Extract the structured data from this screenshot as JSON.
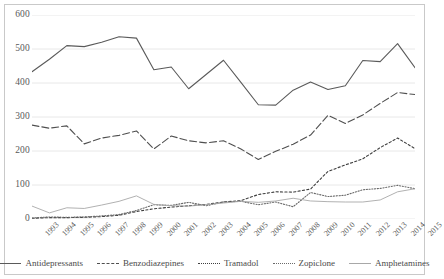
{
  "chart_data": {
    "type": "line",
    "title": "",
    "xlabel": "",
    "ylabel": "",
    "ylim": [
      0,
      600
    ],
    "ytick_values": [
      600,
      500,
      400,
      300,
      200,
      100,
      0
    ],
    "grid": true,
    "grid_axis": "y",
    "legend_position": "bottom",
    "categories": [
      "1993",
      "1994",
      "1995",
      "1996",
      "1997",
      "1998",
      "1999",
      "2000",
      "2001",
      "2002",
      "2003",
      "2004",
      "2005",
      "2006",
      "2007",
      "2008",
      "2009",
      "2010",
      "2011",
      "2012",
      "2013",
      "2014",
      "2015"
    ],
    "series": [
      {
        "name": "Antidepressants",
        "style": "solid",
        "color": "#5a5a5a",
        "values": [
          433,
          470,
          510,
          507,
          520,
          536,
          532,
          439,
          447,
          383,
          425,
          467,
          402,
          336,
          335,
          379,
          403,
          381,
          392,
          466,
          463,
          516,
          445
        ]
      },
      {
        "name": "Benzodiazepines",
        "style": "dashed",
        "color": "#4f4f4f",
        "values": [
          276,
          267,
          274,
          221,
          238,
          246,
          259,
          206,
          244,
          230,
          224,
          230,
          206,
          175,
          199,
          220,
          247,
          305,
          281,
          306,
          340,
          372,
          366
        ]
      },
      {
        "name": "Tramadol",
        "style": "dotted",
        "color": "#3f3f3f",
        "values": [
          2,
          4,
          4,
          5,
          7,
          11,
          22,
          30,
          35,
          39,
          43,
          50,
          54,
          72,
          80,
          79,
          88,
          140,
          159,
          177,
          210,
          238,
          207
        ]
      },
      {
        "name": "Zopiclone",
        "style": "fine-dotted",
        "color": "#6a6a6a",
        "values": [
          3,
          6,
          5,
          6,
          9,
          13,
          25,
          42,
          40,
          49,
          39,
          50,
          52,
          42,
          50,
          36,
          78,
          66,
          70,
          86,
          90,
          99,
          89
        ]
      },
      {
        "name": "Amphetamines",
        "style": "solid-light",
        "color": "#a8a8a8",
        "values": [
          38,
          18,
          33,
          31,
          41,
          52,
          68,
          43,
          39,
          38,
          42,
          47,
          52,
          49,
          53,
          61,
          53,
          51,
          50,
          50,
          56,
          80,
          89
        ]
      }
    ]
  },
  "legend": {
    "items": [
      {
        "label": "Antidepressants"
      },
      {
        "label": "Benzodiazepines"
      },
      {
        "label": "Tramadol"
      },
      {
        "label": "Zopiclone"
      },
      {
        "label": "Amphetamines"
      }
    ]
  }
}
